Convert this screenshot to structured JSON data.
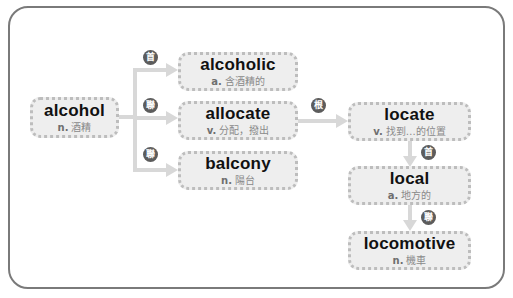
{
  "diagram": {
    "colors": {
      "frame_border": "#7a7a7a",
      "node_fill": "#eeeeee",
      "node_border": "#bdbdbd",
      "connector": "#d8d8d8",
      "badge_fill": "#5c5c5c",
      "word_text": "#111111",
      "definition_text": "#8a8a8a"
    },
    "nodes": {
      "alcohol": {
        "word": "alcohol",
        "pos": "n.",
        "definition": "酒精"
      },
      "alcoholic": {
        "word": "alcoholic",
        "pos": "a.",
        "definition": "含酒精的"
      },
      "allocate": {
        "word": "allocate",
        "pos": "v.",
        "definition": "分配，撥出"
      },
      "balcony": {
        "word": "balcony",
        "pos": "n.",
        "definition": "陽台"
      },
      "locate": {
        "word": "locate",
        "pos": "v.",
        "definition": "找到…的位置"
      },
      "local": {
        "word": "local",
        "pos": "a.",
        "definition": "地方的"
      },
      "locomotive": {
        "word": "locomotive",
        "pos": "n.",
        "definition": "機車"
      }
    },
    "badges": {
      "alcohol_to_alcoholic": "首",
      "alcohol_to_allocate": "聯",
      "alcohol_to_balcony": "聯",
      "allocate_to_locate": "根",
      "locate_to_local": "首",
      "local_to_locomotive": "聯"
    }
  }
}
